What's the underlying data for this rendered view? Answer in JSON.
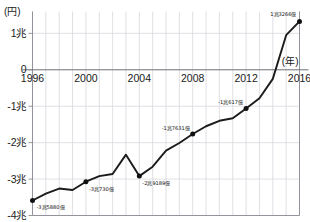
{
  "chart_data": {
    "type": "line",
    "title": "",
    "subtitle": "",
    "xlabel": "(年)",
    "ylabel": "(円)",
    "x": [
      1996,
      1997,
      1998,
      1999,
      2000,
      2001,
      2002,
      2003,
      2004,
      2005,
      2006,
      2007,
      2008,
      2009,
      2010,
      2011,
      2012,
      2013,
      2014,
      2015,
      2016
    ],
    "xlim": [
      1996,
      2016
    ],
    "ylim": [
      -4,
      1.6
    ],
    "y_unit": "兆円",
    "grid": true,
    "legend": null,
    "series": [
      {
        "name": "",
        "values": [
          -3.588,
          -3.4,
          -3.26,
          -3.3,
          -3.073,
          -2.92,
          -2.86,
          -2.33,
          -2.9189,
          -2.66,
          -2.22,
          -2.01,
          -1.7631,
          -1.55,
          -1.4,
          -1.33,
          -1.0617,
          -0.78,
          -0.25,
          0.95,
          1.3266
        ]
      }
    ],
    "x_tick_values": [
      1996,
      2000,
      2004,
      2008,
      2012,
      2016
    ],
    "x_tick_labels": [
      "1996",
      "2000",
      "2004",
      "2008",
      "2012",
      "2016"
    ],
    "y_tick_values": [
      1,
      0,
      -1,
      -2,
      -3,
      -4
    ],
    "y_tick_labels": [
      "1兆",
      "0",
      "-1兆",
      "-2兆",
      "-3兆",
      "-4兆"
    ],
    "annotations": [
      {
        "x": 1996,
        "y": -3.588,
        "label": "-3兆5880億",
        "marker": true,
        "anchor": "start",
        "dx": 4,
        "dy": 9
      },
      {
        "x": 2000,
        "y": -3.073,
        "label": "-3兆730億",
        "marker": true,
        "anchor": "start",
        "dx": 3,
        "dy": 9
      },
      {
        "x": 2004,
        "y": -2.9189,
        "label": "-2兆9189億",
        "marker": true,
        "anchor": "start",
        "dx": 3,
        "dy": 9
      },
      {
        "x": 2008,
        "y": -1.7631,
        "label": "-1兆7631億",
        "marker": true,
        "anchor": "end",
        "dx": -3,
        "dy": -4
      },
      {
        "x": 2012,
        "y": -1.0617,
        "label": "-1兆617億",
        "marker": true,
        "anchor": "end",
        "dx": -3,
        "dy": -4
      },
      {
        "x": 2016,
        "y": 1.3266,
        "label": "1兆3266億",
        "marker": true,
        "anchor": "end",
        "dx": -3,
        "dy": -5
      }
    ]
  },
  "axis": {
    "y_unit_label": "(円)",
    "x_unit_label": "(年)"
  },
  "style": {
    "line_color": "#1b1b1b",
    "marker_color": "#111111",
    "grid_color": "#d8d8de",
    "axis_color": "#8a8a92",
    "zero_line_color": "#6f6f78",
    "background": "#ffffff"
  }
}
